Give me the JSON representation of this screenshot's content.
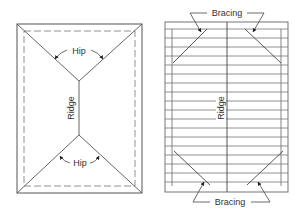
{
  "diagram": {
    "left": {
      "title": "Hip roof plan",
      "labels": {
        "hip_top": "Hip",
        "hip_bottom": "Hip",
        "ridge": "Ridge"
      }
    },
    "right": {
      "title": "Roof framing with bracing",
      "labels": {
        "bracing_top": "Bracing",
        "bracing_bottom": "Bracing",
        "ridge": "Ridge"
      }
    },
    "colors": {
      "line": "#555555",
      "dashed": "#777777",
      "arrow": "#222222",
      "text": "#333333"
    }
  }
}
